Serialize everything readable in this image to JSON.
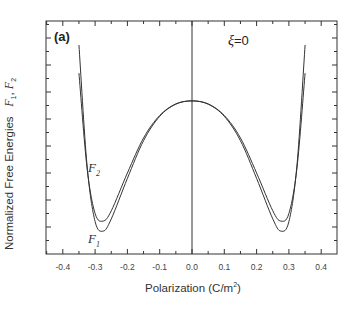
{
  "panel_label": "(a)",
  "annotation": {
    "symbol": "ξ",
    "text": "=0"
  },
  "axes": {
    "xlabel_prefix": "Polarization (C/m",
    "xlabel_sup": "2",
    "xlabel_suffix": ")",
    "ylabel_text": "Normalized Free Energies",
    "ylabel_f1": "F",
    "ylabel_f1_sub": "1",
    "ylabel_sep": ", ",
    "ylabel_f2": "F",
    "ylabel_f2_sub": "2"
  },
  "curve_labels": {
    "f1": {
      "main": "F",
      "sub": "1"
    },
    "f2": {
      "main": "F",
      "sub": "2"
    }
  },
  "chart_data": {
    "type": "line",
    "title": "",
    "panel": "(a)",
    "annotation": "ξ=0",
    "xlabel": "Polarization (C/m²)",
    "ylabel": "Normalized Free Energies F1, F2",
    "xlim": [
      -0.45,
      0.45
    ],
    "ylim": [
      0,
      8.6
    ],
    "xticks": [
      -0.4,
      -0.3,
      -0.2,
      -0.1,
      0.0,
      0.1,
      0.2,
      0.3,
      0.4
    ],
    "xtick_labels": [
      "-0.4",
      "-0.3",
      "-0.2",
      "-0.1",
      "0.0",
      "0.1",
      "0.2",
      "0.3",
      "0.4"
    ],
    "yticks_labeled": false,
    "grid": false,
    "vertical_line_at_x": 0.0,
    "x": [
      -0.35,
      -0.325,
      -0.3,
      -0.275,
      -0.25,
      -0.2,
      -0.15,
      -0.1,
      -0.05,
      0.0,
      0.05,
      0.1,
      0.15,
      0.2,
      0.25,
      0.275,
      0.3,
      0.325,
      0.35
    ],
    "series": [
      {
        "name": "F1",
        "values": [
          7.74,
          3.3,
          1.2,
          0.85,
          1.3,
          2.8,
          4.2,
          5.1,
          5.55,
          5.67,
          5.55,
          5.1,
          4.2,
          2.8,
          1.3,
          0.85,
          1.2,
          3.3,
          7.74
        ]
      },
      {
        "name": "F2",
        "values": [
          6.7,
          3.2,
          1.5,
          1.22,
          1.6,
          3.0,
          4.3,
          5.13,
          5.56,
          5.67,
          5.56,
          5.13,
          4.3,
          3.0,
          1.6,
          1.22,
          1.5,
          3.2,
          6.7
        ]
      }
    ]
  }
}
